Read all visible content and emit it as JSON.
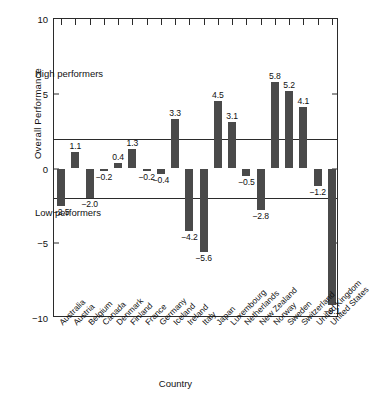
{
  "chart_data": {
    "type": "bar",
    "title": "",
    "xlabel": "Country",
    "ylabel": "Overall Performance",
    "ylim": [
      -10,
      10
    ],
    "yticks": [
      10,
      5,
      0,
      -5,
      -10
    ],
    "ytick_labels": [
      "10",
      "5",
      "0",
      "-5",
      "-10"
    ],
    "grid": false,
    "legend": null,
    "reference_lines": [
      {
        "value": 2,
        "label": "high performer threshold"
      },
      {
        "value": -2,
        "label": "low performer threshold"
      }
    ],
    "annotations": [
      {
        "text": "High performers",
        "region": "above +2"
      },
      {
        "text": "Low performers",
        "region": "below -2"
      }
    ],
    "categories": [
      "Australia",
      "Austria",
      "Belgium",
      "Canada",
      "Denmark",
      "Finland",
      "France",
      "Germany",
      "Iceland",
      "Ireland",
      "Italy",
      "Japan",
      "Luxembourg",
      "Netherlands",
      "New Zealand",
      "Norway",
      "Sweden",
      "Switzerland",
      "United Kingdom",
      "United States"
    ],
    "values": [
      -2.5,
      1.1,
      -2.0,
      -0.2,
      0.4,
      1.3,
      -0.2,
      -0.4,
      3.3,
      -4.2,
      -5.6,
      4.5,
      3.1,
      -0.5,
      -2.8,
      5.8,
      5.2,
      4.1,
      -1.2,
      -9.1
    ],
    "value_labels": [
      "-2.5",
      "1.1",
      "-2.0",
      "-0.2",
      "0.4",
      "1.3",
      "-0.2",
      "-0.4",
      "3.3",
      "-4.2",
      "-5.6",
      "4.5",
      "3.1",
      "-0.5",
      "-2.8",
      "5.8",
      "5.2",
      "4.1",
      "-1.2",
      "-9.1"
    ],
    "colors": {
      "bar": "#4a4a4a",
      "axis": "#2b2b2b",
      "text": "#111111",
      "background": "#ffffff"
    }
  },
  "axis": {
    "y_title": "Overall Performance",
    "x_title": "Country"
  },
  "regions": {
    "high": "High performers",
    "low": "Low performers"
  }
}
